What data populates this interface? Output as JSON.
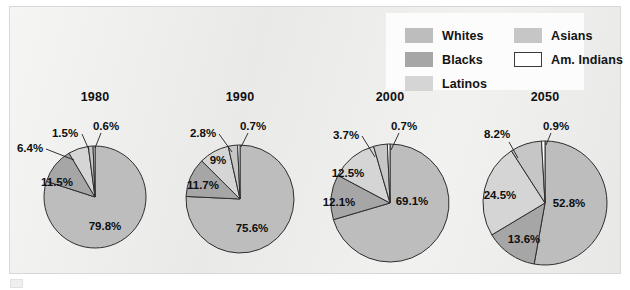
{
  "figure": {
    "background_color": "#e9e9e7",
    "frame_color": "#d8d8d6",
    "legend_background": "#fcfcfc"
  },
  "legend": {
    "items": [
      {
        "label": "Whites",
        "color": "#bdbdbd",
        "outlined": false,
        "col": 0,
        "row": 0
      },
      {
        "label": "Blacks",
        "color": "#a6a6a6",
        "outlined": false,
        "col": 0,
        "row": 1
      },
      {
        "label": "Latinos",
        "color": "#d5d5d5",
        "outlined": false,
        "col": 0,
        "row": 2
      },
      {
        "label": "Asians",
        "color": "#c6c6c6",
        "outlined": false,
        "col": 1,
        "row": 0
      },
      {
        "label": "Am. Indians",
        "color": "#ffffff",
        "outlined": true,
        "col": 1,
        "row": 1
      }
    ]
  },
  "chart_data": {
    "type": "pie",
    "title": "",
    "categories": [
      "Whites",
      "Blacks",
      "Latinos",
      "Asians",
      "Am. Indians"
    ],
    "colors": {
      "Whites": "#bdbdbd",
      "Blacks": "#a6a6a6",
      "Latinos": "#d5d5d5",
      "Asians": "#c6c6c6",
      "Am. Indians": "#ffffff"
    },
    "legend_position": "top-right",
    "charts": [
      {
        "title": "1980",
        "cx": 95,
        "cy": 197,
        "r": 51,
        "title_x": 95,
        "title_y": 99,
        "values": [
          79.8,
          11.5,
          6.4,
          1.5,
          0.6
        ],
        "labels": [
          "79.8%",
          "11.5%",
          "6.4%",
          "1.5%",
          "0.6%"
        ],
        "label_positions": [
          {
            "text": "79.8%",
            "x": 105,
            "y": 230,
            "anchor": "middle",
            "leader": null
          },
          {
            "text": "11.5%",
            "x": 57,
            "y": 186,
            "anchor": "middle",
            "leader": null
          },
          {
            "text": "6.4%",
            "x": 30,
            "y": 152,
            "anchor": "middle",
            "leader": {
              "x1": 46,
              "y1": 149,
              "x2": 74,
              "y2": 160
            }
          },
          {
            "text": "1.5%",
            "x": 65,
            "y": 137,
            "anchor": "middle",
            "leader": {
              "x1": 82,
              "y1": 134,
              "x2": 89,
              "y2": 150
            }
          },
          {
            "text": "0.6%",
            "x": 106,
            "y": 130,
            "anchor": "middle",
            "leader": {
              "x1": 101,
              "y1": 133,
              "x2": 95,
              "y2": 148
            }
          }
        ]
      },
      {
        "title": "1990",
        "cx": 240,
        "cy": 199,
        "r": 54,
        "title_x": 240,
        "title_y": 99,
        "values": [
          75.6,
          11.7,
          9.0,
          2.8,
          0.7
        ],
        "labels": [
          "75.6%",
          "11.7%",
          "9%",
          "2.8%",
          "0.7%"
        ],
        "label_positions": [
          {
            "text": "75.6%",
            "x": 252,
            "y": 232,
            "anchor": "middle",
            "leader": null
          },
          {
            "text": "11.7%",
            "x": 203,
            "y": 189,
            "anchor": "middle",
            "leader": null
          },
          {
            "text": "9%",
            "x": 218,
            "y": 164,
            "anchor": "middle",
            "leader": null
          },
          {
            "text": "2.8%",
            "x": 203,
            "y": 137,
            "anchor": "middle",
            "leader": {
              "x1": 219,
              "y1": 134,
              "x2": 232,
              "y2": 152
            }
          },
          {
            "text": "0.7%",
            "x": 253,
            "y": 130,
            "anchor": "middle",
            "leader": {
              "x1": 248,
              "y1": 133,
              "x2": 241,
              "y2": 147
            }
          }
        ]
      },
      {
        "title": "2000",
        "cx": 390,
        "cy": 203,
        "r": 59,
        "title_x": 390,
        "title_y": 99,
        "values": [
          69.1,
          12.1,
          12.5,
          3.7,
          0.7
        ],
        "labels": [
          "69.1%",
          "12.1%",
          "12.5%",
          "3.7%",
          "0.7%"
        ],
        "label_positions": [
          {
            "text": "69.1%",
            "x": 412,
            "y": 205,
            "anchor": "middle",
            "leader": null
          },
          {
            "text": "12.1%",
            "x": 339,
            "y": 206,
            "anchor": "middle",
            "leader": null
          },
          {
            "text": "12.5%",
            "x": 348,
            "y": 177,
            "anchor": "middle",
            "leader": null
          },
          {
            "text": "3.7%",
            "x": 346,
            "y": 139,
            "anchor": "middle",
            "leader": {
              "x1": 362,
              "y1": 136,
              "x2": 375,
              "y2": 157
            }
          },
          {
            "text": "0.7%",
            "x": 404,
            "y": 130,
            "anchor": "middle",
            "leader": {
              "x1": 399,
              "y1": 133,
              "x2": 391,
              "y2": 150
            }
          }
        ]
      },
      {
        "title": "2050",
        "cx": 545,
        "cy": 203,
        "r": 62,
        "title_x": 545,
        "title_y": 99,
        "values": [
          52.8,
          13.6,
          24.5,
          8.2,
          0.9
        ],
        "labels": [
          "52.8%",
          "13.6%",
          "24.5%",
          "8.2%",
          "0.9%"
        ],
        "label_positions": [
          {
            "text": "52.8%",
            "x": 569,
            "y": 207,
            "anchor": "middle",
            "leader": null
          },
          {
            "text": "13.6%",
            "x": 524,
            "y": 243,
            "anchor": "middle",
            "leader": null
          },
          {
            "text": "24.5%",
            "x": 500,
            "y": 199,
            "anchor": "middle",
            "leader": null
          },
          {
            "text": "8.2%",
            "x": 497,
            "y": 138,
            "anchor": "middle",
            "leader": {
              "x1": 509,
              "y1": 142,
              "x2": 518,
              "y2": 158
            }
          },
          {
            "text": "0.9%",
            "x": 556,
            "y": 130,
            "anchor": "middle",
            "leader": {
              "x1": 551,
              "y1": 133,
              "x2": 546,
              "y2": 145
            }
          }
        ]
      }
    ]
  }
}
